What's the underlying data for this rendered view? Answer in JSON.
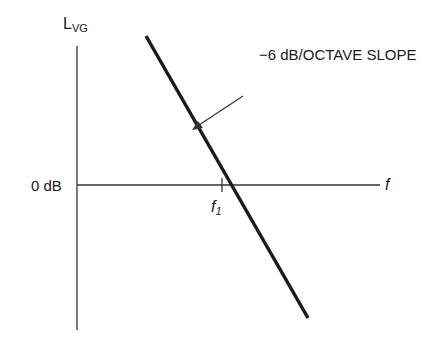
{
  "diagram": {
    "y_axis_label": "L",
    "y_axis_label_sub": "VG",
    "x_axis_label": "f",
    "zero_level_label": "0 dB",
    "crossing_label": "f",
    "crossing_label_sub": "1",
    "slope_annotation": "−6 dB/OCTAVE SLOPE",
    "colors": {
      "line": "#1a1a1a",
      "axis": "#333333",
      "background": "#ffffff"
    }
  }
}
